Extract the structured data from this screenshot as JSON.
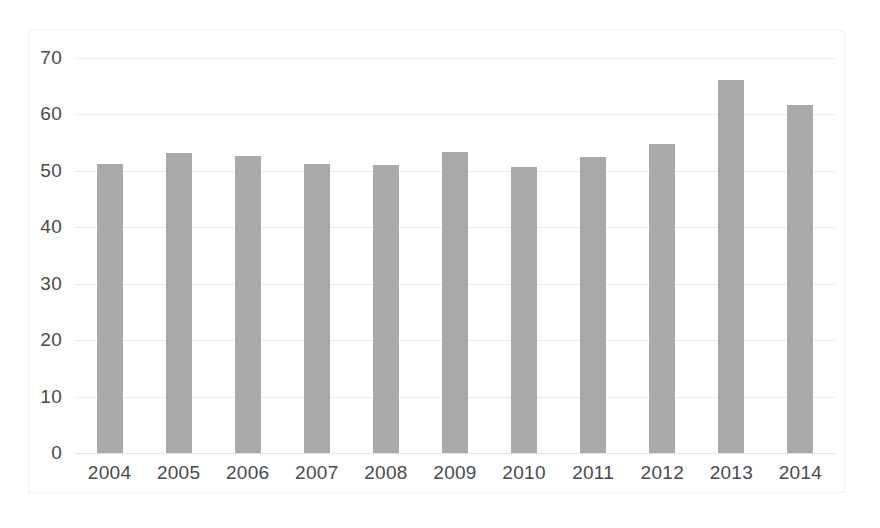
{
  "chart_data": {
    "type": "bar",
    "title": "",
    "subtitle": "",
    "xlabel": "",
    "ylabel": "",
    "categories": [
      "2004",
      "2005",
      "2006",
      "2007",
      "2008",
      "2009",
      "2010",
      "2011",
      "2012",
      "2013",
      "2014"
    ],
    "values": [
      51.3,
      53.2,
      52.7,
      51.2,
      51.0,
      53.3,
      50.6,
      52.4,
      54.7,
      66.1,
      61.7
    ],
    "series": [
      {
        "name": "",
        "values": [
          51.3,
          53.2,
          52.7,
          51.2,
          51.0,
          53.3,
          50.6,
          52.4,
          54.7,
          66.1,
          61.7
        ]
      }
    ],
    "ylim": [
      0,
      70
    ],
    "ytick_labels": [
      "70",
      "60",
      "50",
      "40",
      "30",
      "20",
      "10",
      "0"
    ],
    "ytick_values": [
      70,
      60,
      50,
      40,
      30,
      20,
      10,
      0
    ],
    "grid": true,
    "legend": "none",
    "bar_color": "#a9a9a9",
    "gridline_color": "#ededed",
    "axis_text_color": "#4a4a4a",
    "background_color": "#ffffff",
    "frame_color": "#f0f0f0"
  }
}
